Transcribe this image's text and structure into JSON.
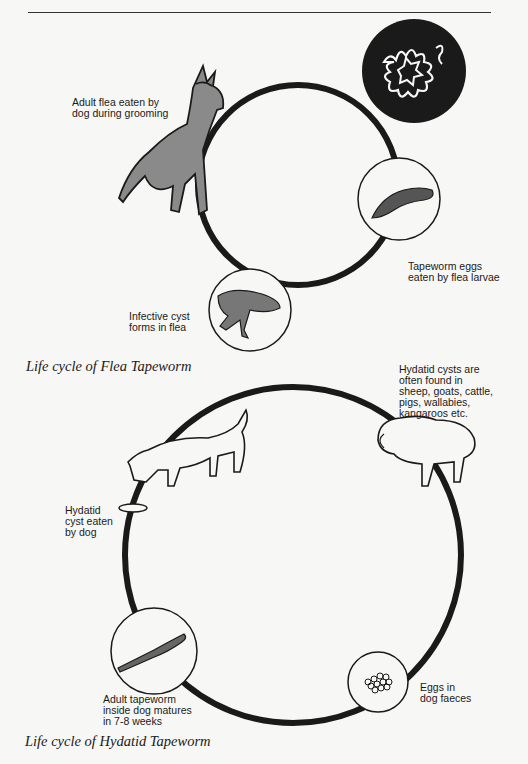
{
  "figure": {
    "flea_cycle": {
      "caption": "Life cycle of Flea Tapeworm",
      "labels": {
        "dog": "Adult flea eaten by\ndog during grooming",
        "larva": "Tapeworm eggs\neaten by flea larvae",
        "flea": "Infective cyst\nforms in flea"
      },
      "icons": [
        "dog-icon",
        "worm-circle-icon",
        "flea-larva-icon",
        "flea-icon"
      ]
    },
    "hydatid_cycle": {
      "caption": "Life cycle of Hydatid Tapeworm",
      "labels": {
        "sheep": "Hydatid cysts are\noften found in\nsheep, goats, cattle,\npigs, wallabies,\nkangaroos etc.",
        "dog": "Hydatid\ncyst eaten\nby dog",
        "tapeworm": "Adult tapeworm\ninside dog matures\nin 7-8 weeks",
        "eggs": "Eggs in\ndog faeces"
      },
      "icons": [
        "sheep-icon",
        "dog-eating-icon",
        "tapeworm-icon",
        "eggs-icon"
      ]
    },
    "colors": {
      "ink": "#1a1a1a",
      "paper": "#f7f7f5"
    }
  }
}
